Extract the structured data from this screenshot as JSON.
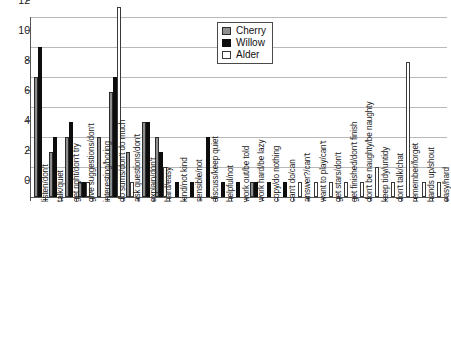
{
  "chart_data": {
    "type": "bar",
    "title": "",
    "xlabel": "",
    "ylabel": "",
    "ylim": [
      0,
      12
    ],
    "ytick_values": [
      0,
      2,
      4,
      6,
      8,
      10,
      12
    ],
    "ytick_labels": [
      "0",
      "2",
      "4",
      "6",
      "8",
      "10",
      "12"
    ],
    "grid": true,
    "legend_position": "top-right",
    "legend": [
      "Cherry",
      "Willow",
      "Alder"
    ],
    "colors": {
      "Cherry": "#8f8f8f",
      "Willow": "#0d0d0d",
      "Alder": "#ffffff"
    },
    "categories": [
      "listen/don't",
      "talk/quiet",
      "get right/don't try",
      "give suggestions/don't",
      "interesting/boring",
      "do sums/don't do much",
      "ask questions/don't",
      "explain/don't",
      "hard/easy",
      "kind/not kind",
      "sensible/not",
      "discuss/keep quiet",
      "helpful/not",
      "work out/be told",
      "work hard/be lazy",
      "copy/do nothing",
      "can't do/can",
      "answer?/can't",
      "want to play/can't",
      "get stars/don't",
      "get finished/don't finish",
      "don't be naughty/be naughty",
      "keep tidy/untidy",
      "don't talk/chat",
      "remember/forget",
      "hands up/shout",
      "easy/hard"
    ],
    "series": [
      {
        "name": "Cherry",
        "values": [
          8,
          3,
          4,
          1,
          4,
          7,
          3,
          5,
          4,
          0,
          0,
          0,
          0,
          0,
          1,
          0,
          0,
          0,
          0,
          0,
          0,
          0,
          0,
          0,
          0,
          0,
          0
        ]
      },
      {
        "name": "Willow",
        "values": [
          10,
          4,
          5,
          1,
          0,
          8,
          0,
          5,
          3,
          1,
          1,
          4,
          1,
          1,
          1,
          1,
          1,
          0,
          0,
          0,
          0,
          0,
          0,
          0,
          0,
          0,
          0
        ]
      },
      {
        "name": "Alder",
        "values": [
          0,
          0,
          0,
          1,
          0,
          12,
          1,
          0,
          2,
          0,
          0,
          0,
          0,
          0,
          0,
          0,
          0,
          1,
          1,
          1,
          1,
          1,
          2,
          1,
          9,
          1,
          1
        ]
      }
    ]
  }
}
